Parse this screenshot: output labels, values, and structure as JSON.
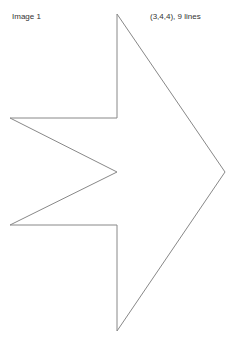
{
  "header": {
    "title": "Image 1",
    "info": "(3,4,4), 9 lines"
  },
  "figure": {
    "shape": "arrow-polygon",
    "stroke_color": "#888888",
    "fill_color": "#ffffff",
    "stroke_width": 1,
    "points": [
      [
        117,
        14
      ],
      [
        225,
        172
      ],
      [
        117,
        331
      ],
      [
        117,
        225
      ],
      [
        10,
        225
      ],
      [
        117,
        172
      ],
      [
        10,
        118
      ],
      [
        117,
        118
      ]
    ]
  }
}
